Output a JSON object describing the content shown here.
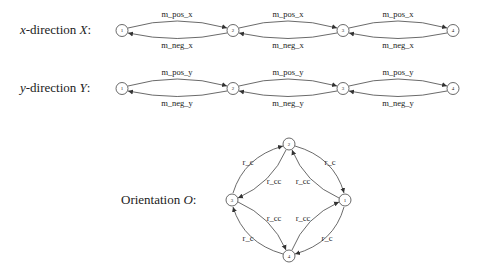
{
  "rows": [
    {
      "label": "x-direction X:",
      "label_var": "x",
      "label_rest": "-direction ",
      "label_sym": "X",
      "nodes": [
        "1",
        "2",
        "3",
        "4"
      ],
      "edge_pos": "m_pos_x",
      "edge_neg": "m_neg_x"
    },
    {
      "label": "y-direction Y:",
      "label_var": "y",
      "label_rest": "-direction ",
      "label_sym": "Y",
      "nodes": [
        "1",
        "2",
        "3",
        "4"
      ],
      "edge_pos": "m_pos_y",
      "edge_neg": "m_neg_y"
    }
  ],
  "orientation": {
    "label_text": "Orientation ",
    "label_sym": "O",
    "nodes": {
      "top": "2",
      "left": "3",
      "right": "1",
      "bottom": "4"
    },
    "edges": {
      "top_left_outer": "r_c",
      "top_left_inner": "r_cc",
      "top_right_outer": "r_c",
      "top_right_inner": "r_cc",
      "bottom_left_inner": "r_cc",
      "bottom_left_outer": "r_c",
      "bottom_right_inner": "r_cc",
      "bottom_right_outer": "r_c"
    }
  }
}
